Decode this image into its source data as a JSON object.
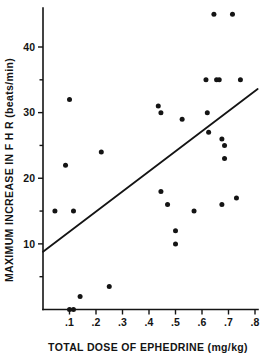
{
  "chart_data": {
    "type": "scatter",
    "title": "",
    "xlabel": "TOTAL DOSE OF EPHEDRINE  (mg/kg)",
    "ylabel": "MAXIMUM INCREASE IN F H R  (beats/min)",
    "xlim": [
      0.0,
      0.8
    ],
    "ylim": [
      0,
      46
    ],
    "grid": false,
    "legend": null,
    "xticks": [
      0.1,
      0.2,
      0.3,
      0.4,
      0.5,
      0.6,
      0.7,
      0.8
    ],
    "xtick_labels": [
      ".1",
      ".2",
      ".3",
      ".4",
      ".5",
      ".6",
      ".7",
      ".8"
    ],
    "yticks": [
      10,
      20,
      30,
      40
    ],
    "ytick_labels": [
      "10",
      "20",
      "30",
      "40"
    ],
    "yticks_minor": [
      5,
      15,
      25,
      35
    ],
    "marker": "filled-circle",
    "marker_color": "#141414",
    "points": [
      {
        "x": 0.045,
        "y": 15.0
      },
      {
        "x": 0.085,
        "y": 22.0
      },
      {
        "x": 0.1,
        "y": 32.0
      },
      {
        "x": 0.1,
        "y": 0.0
      },
      {
        "x": 0.115,
        "y": 0.0
      },
      {
        "x": 0.115,
        "y": 15.0
      },
      {
        "x": 0.14,
        "y": 2.0
      },
      {
        "x": 0.22,
        "y": 24.0
      },
      {
        "x": 0.25,
        "y": 3.5
      },
      {
        "x": 0.435,
        "y": 31.0
      },
      {
        "x": 0.445,
        "y": 30.0
      },
      {
        "x": 0.445,
        "y": 18.0
      },
      {
        "x": 0.47,
        "y": 16.0
      },
      {
        "x": 0.5,
        "y": 12.0
      },
      {
        "x": 0.5,
        "y": 10.0
      },
      {
        "x": 0.525,
        "y": 29.0
      },
      {
        "x": 0.57,
        "y": 15.0
      },
      {
        "x": 0.615,
        "y": 35.0
      },
      {
        "x": 0.62,
        "y": 30.0
      },
      {
        "x": 0.625,
        "y": 27.0
      },
      {
        "x": 0.645,
        "y": 45.0
      },
      {
        "x": 0.655,
        "y": 35.0
      },
      {
        "x": 0.665,
        "y": 35.0
      },
      {
        "x": 0.675,
        "y": 26.0
      },
      {
        "x": 0.675,
        "y": 16.0
      },
      {
        "x": 0.685,
        "y": 25.0
      },
      {
        "x": 0.685,
        "y": 23.0
      },
      {
        "x": 0.715,
        "y": 45.0
      },
      {
        "x": 0.73,
        "y": 17.0
      },
      {
        "x": 0.745,
        "y": 35.0
      }
    ],
    "fit_line": {
      "type": "linear-regression",
      "x_start": 0.0,
      "y_start": 8.8,
      "x_end": 0.81,
      "y_end": 33.6
    }
  },
  "colors": {
    "ink": "#141414",
    "background": "#ffffff"
  }
}
